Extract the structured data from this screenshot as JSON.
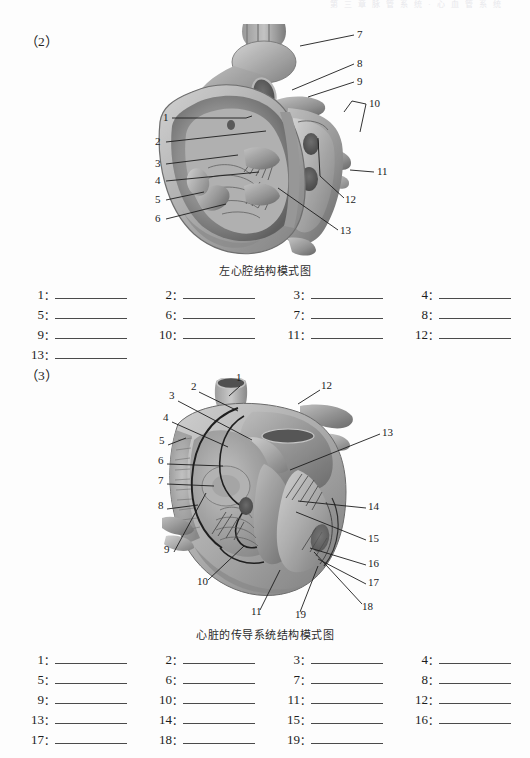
{
  "page": {
    "running_header": "第 三 章  脉 管 系 统 · 心 血 管 系 统"
  },
  "sections": [
    {
      "marker": "（2）",
      "figure": {
        "caption": "左心腔结构模式图",
        "label_count": 13,
        "labels": [
          {
            "n": "1",
            "x": 163,
            "y": 121
          },
          {
            "n": "2",
            "x": 155,
            "y": 145
          },
          {
            "n": "3",
            "x": 155,
            "y": 167
          },
          {
            "n": "4",
            "x": 155,
            "y": 184
          },
          {
            "n": "5",
            "x": 155,
            "y": 203
          },
          {
            "n": "6",
            "x": 155,
            "y": 222
          },
          {
            "n": "7",
            "x": 357,
            "y": 37
          },
          {
            "n": "8",
            "x": 357,
            "y": 66
          },
          {
            "n": "9",
            "x": 357,
            "y": 84
          },
          {
            "n": "10",
            "x": 370,
            "y": 104
          },
          {
            "n": "11",
            "x": 377,
            "y": 173
          },
          {
            "n": "12",
            "x": 347,
            "y": 200
          },
          {
            "n": "13",
            "x": 341,
            "y": 231
          }
        ]
      },
      "blanks": {
        "numbers": [
          "1",
          "2",
          "3",
          "4",
          "5",
          "6",
          "7",
          "8",
          "9",
          "10",
          "11",
          "12",
          "13"
        ],
        "colon": "："
      }
    },
    {
      "marker": "（3）",
      "figure": {
        "caption": "心脏的传导系统结构模式图",
        "label_count": 19,
        "labels": [
          {
            "n": "1",
            "x": 236,
            "y": 378
          },
          {
            "n": "2",
            "x": 192,
            "y": 387
          },
          {
            "n": "3",
            "x": 170,
            "y": 396
          },
          {
            "n": "4",
            "x": 164,
            "y": 418
          },
          {
            "n": "5",
            "x": 160,
            "y": 441
          },
          {
            "n": "6",
            "x": 159,
            "y": 461
          },
          {
            "n": "7",
            "x": 159,
            "y": 481
          },
          {
            "n": "8",
            "x": 159,
            "y": 506
          },
          {
            "n": "9",
            "x": 165,
            "y": 550
          },
          {
            "n": "10",
            "x": 199,
            "y": 583
          },
          {
            "n": "11",
            "x": 253,
            "y": 613
          },
          {
            "n": "12",
            "x": 322,
            "y": 382
          },
          {
            "n": "13",
            "x": 383,
            "y": 430
          },
          {
            "n": "14",
            "x": 369,
            "y": 505
          },
          {
            "n": "15",
            "x": 369,
            "y": 537
          },
          {
            "n": "16",
            "x": 369,
            "y": 562
          },
          {
            "n": "17",
            "x": 369,
            "y": 581
          },
          {
            "n": "18",
            "x": 363,
            "y": 608
          },
          {
            "n": "19",
            "x": 297,
            "y": 616
          }
        ]
      },
      "blanks": {
        "numbers": [
          "1",
          "2",
          "3",
          "4",
          "5",
          "6",
          "7",
          "8",
          "9",
          "10",
          "11",
          "12",
          "13",
          "14",
          "15",
          "16",
          "17",
          "18",
          "19"
        ],
        "colon": "："
      }
    }
  ],
  "colors": {
    "rule": "#4a4a4a",
    "text": "#1a1a1a",
    "paper": "#fdfdfd",
    "tissue_light": "#cfcac4",
    "tissue_mid": "#a7a29c",
    "tissue_dark": "#6f6a66",
    "tissue_deep": "#4d4945"
  }
}
